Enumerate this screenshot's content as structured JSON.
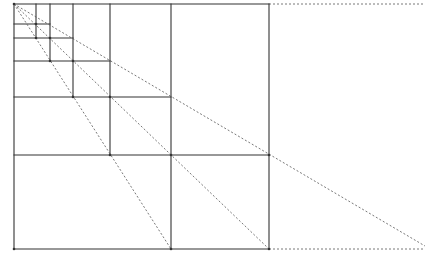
{
  "diagram": {
    "title": "",
    "colors": {
      "background": "#ffffff",
      "line": "#333333",
      "dashed": "#555555"
    },
    "origin": [
      14,
      4
    ],
    "solid_lines": [
      {
        "x1": 14,
        "y1": 4,
        "x2": 269,
        "y2": 4
      },
      {
        "x1": 14,
        "y1": 4,
        "x2": 14,
        "y2": 249
      },
      {
        "x1": 14,
        "y1": 249,
        "x2": 269,
        "y2": 249
      },
      {
        "x1": 269,
        "y1": 4,
        "x2": 269,
        "y2": 249
      },
      {
        "x1": 171,
        "y1": 4,
        "x2": 171,
        "y2": 249
      },
      {
        "x1": 110,
        "y1": 4,
        "x2": 110,
        "y2": 155
      },
      {
        "x1": 73,
        "y1": 4,
        "x2": 73,
        "y2": 97
      },
      {
        "x1": 50,
        "y1": 4,
        "x2": 50,
        "y2": 61
      },
      {
        "x1": 36,
        "y1": 4,
        "x2": 36,
        "y2": 38
      },
      {
        "x1": 14,
        "y1": 155,
        "x2": 269,
        "y2": 155
      },
      {
        "x1": 14,
        "y1": 97,
        "x2": 171,
        "y2": 97
      },
      {
        "x1": 14,
        "y1": 61,
        "x2": 110,
        "y2": 61
      },
      {
        "x1": 14,
        "y1": 38,
        "x2": 73,
        "y2": 38
      },
      {
        "x1": 14,
        "y1": 24,
        "x2": 50,
        "y2": 24
      }
    ],
    "dashed_lines": [
      {
        "x1": 269,
        "y1": 4,
        "x2": 425,
        "y2": 4
      },
      {
        "x1": 269,
        "y1": 249,
        "x2": 425,
        "y2": 249
      },
      {
        "x1": 14,
        "y1": 4,
        "x2": 425,
        "y2": 246
      },
      {
        "x1": 14,
        "y1": 4,
        "x2": 269,
        "y2": 249
      },
      {
        "x1": 14,
        "y1": 4,
        "x2": 171,
        "y2": 249
      }
    ],
    "vertices": [
      [
        14,
        4
      ],
      [
        269,
        155
      ],
      [
        171,
        155
      ],
      [
        110,
        97
      ],
      [
        73,
        61
      ],
      [
        50,
        38
      ],
      [
        36,
        24
      ],
      [
        269,
        249
      ],
      [
        171,
        249
      ],
      [
        110,
        155
      ],
      [
        73,
        97
      ],
      [
        50,
        61
      ],
      [
        36,
        38
      ],
      [
        14,
        249
      ]
    ]
  }
}
